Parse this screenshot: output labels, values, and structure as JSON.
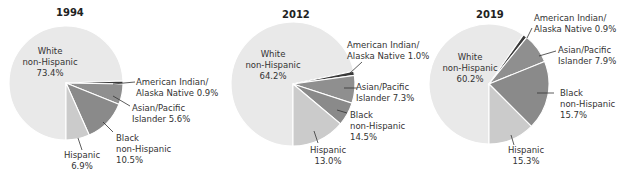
{
  "chart_data": [
    {
      "type": "pie",
      "title": "1994",
      "categories": [
        "White non-Hispanic",
        "American Indian/Alaska Native",
        "Asian/Pacific Islander",
        "Black non-Hispanic",
        "Hispanic"
      ],
      "values": [
        73.4,
        0.9,
        5.6,
        10.5,
        6.9
      ],
      "labels": [
        "White non-Hispanic 73.4%",
        "American Indian/Alaska Native 0.9%",
        "Asian/Pacific Islander 5.6%",
        "Black non-Hispanic 10.5%",
        "Hispanic 6.9%"
      ]
    },
    {
      "type": "pie",
      "title": "2012",
      "categories": [
        "White non-Hispanic",
        "American Indian/Alaska Native",
        "Asian/Pacific Islander",
        "Black non-Hispanic",
        "Hispanic"
      ],
      "values": [
        64.2,
        1.0,
        7.3,
        14.5,
        13.0
      ],
      "labels": [
        "White non-Hispanic 64.2%",
        "American Indian/Alaska Native 1.0%",
        "Asian/Pacific Islander 7.3%",
        "Black non-Hispanic 14.5%",
        "Hispanic 13.0%"
      ]
    },
    {
      "type": "pie",
      "title": "2019",
      "categories": [
        "White non-Hispanic",
        "American Indian/Alaska Native",
        "Asian/Pacific Islander",
        "Black non-Hispanic",
        "Hispanic"
      ],
      "values": [
        60.2,
        0.9,
        7.9,
        15.7,
        15.3
      ],
      "labels": [
        "White non-Hispanic 60.2%",
        "American Indian/Alaska Native 0.9%",
        "Asian/Pacific Islander 7.9%",
        "Black non-Hispanic 15.7%",
        "Hispanic 15.3%"
      ]
    }
  ],
  "colors": {
    "white_nh": "#e9e9e9",
    "aian": "#3a3a3a",
    "asian_pi": "#8f8f8f",
    "black_nh": "#8a8a8a",
    "hispanic": "#cbcbcb",
    "separator": "#ffffff",
    "leader": "#333333"
  },
  "panels": {
    "p1994": {
      "title": "1994",
      "white": [
        "White",
        "non-Hispanic",
        "73.4%"
      ],
      "aian": [
        "American Indian/",
        "Alaska Native 0.9%"
      ],
      "asian": [
        "Asian/Pacific",
        "Islander 5.6%"
      ],
      "black": [
        "Black",
        "non-Hispanic",
        "10.5%"
      ],
      "hisp": [
        "Hispanic",
        "6.9%"
      ]
    },
    "p2012": {
      "title": "2012",
      "white": [
        "White",
        "non-Hispanic",
        "64.2%"
      ],
      "aian": [
        "American Indian/",
        "Alaska Native 1.0%"
      ],
      "asian": [
        "Asian/Pacific",
        "Islander 7.3%"
      ],
      "black": [
        "Black",
        "non-Hispanic",
        "14.5%"
      ],
      "hisp": [
        "Hispanic",
        "13.0%"
      ]
    },
    "p2019": {
      "title": "2019",
      "white": [
        "White",
        "non-Hispanic",
        "60.2%"
      ],
      "aian": [
        "American Indian/",
        "Alaska Native 0.9%"
      ],
      "asian": [
        "Asian/Pacific",
        "Islander 7.9%"
      ],
      "black": [
        "Black",
        "non-Hispanic",
        "15.7%"
      ],
      "hisp": [
        "Hispanic",
        "15.3%"
      ]
    }
  }
}
